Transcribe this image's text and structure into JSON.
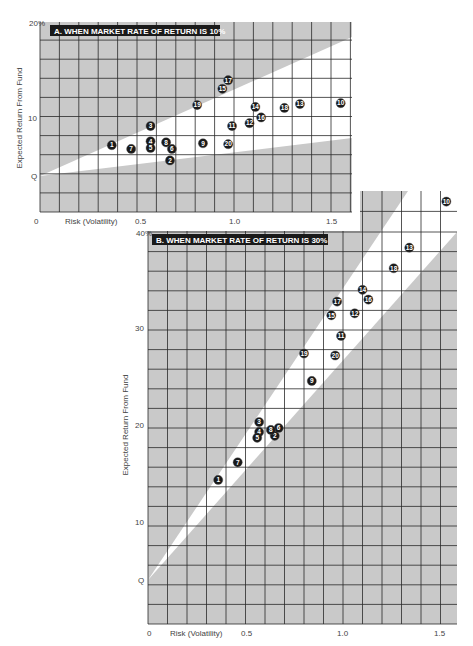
{
  "chart_data": [
    {
      "id": "A",
      "type": "scatter",
      "title": "A. WHEN MARKET RATE OF RETURN IS 10%",
      "xlabel": "Risk (Volatility)",
      "ylabel": "Expected Return From Fund",
      "x_ticks": [
        "0",
        "0.5",
        "1.0",
        "1.5"
      ],
      "x_tick_values": [
        0,
        0.5,
        1.0,
        1.5
      ],
      "y_ticks": [
        "20%",
        "10",
        "Q"
      ],
      "y_tick_values": [
        20,
        10,
        4
      ],
      "xlim": [
        0,
        1.61
      ],
      "ylim": [
        0,
        20
      ],
      "grid": true,
      "grid_step_x": 0.1,
      "grid_step_y": 2,
      "market_line": {
        "intercept_label": "Q",
        "intercept": 4,
        "band_upper_at_xmax": 18.4,
        "band_lower_at_xmax": 7.9
      },
      "points": [
        {
          "label": "1",
          "x": 0.37,
          "y": 7.0
        },
        {
          "label": "2",
          "x": 0.67,
          "y": 5.4
        },
        {
          "label": "3",
          "x": 0.57,
          "y": 9.0
        },
        {
          "label": "4",
          "x": 0.57,
          "y": 7.4
        },
        {
          "label": "5",
          "x": 0.57,
          "y": 6.7
        },
        {
          "label": "6",
          "x": 0.68,
          "y": 6.6
        },
        {
          "label": "7",
          "x": 0.47,
          "y": 6.6
        },
        {
          "label": "8",
          "x": 0.65,
          "y": 7.3
        },
        {
          "label": "9",
          "x": 0.84,
          "y": 7.2
        },
        {
          "label": "10",
          "x": 1.55,
          "y": 11.4
        },
        {
          "label": "11",
          "x": 0.99,
          "y": 9.0
        },
        {
          "label": "12",
          "x": 1.08,
          "y": 9.3
        },
        {
          "label": "13",
          "x": 1.34,
          "y": 11.3
        },
        {
          "label": "14",
          "x": 1.11,
          "y": 11.0
        },
        {
          "label": "15",
          "x": 0.94,
          "y": 12.9
        },
        {
          "label": "16",
          "x": 1.14,
          "y": 9.9
        },
        {
          "label": "17",
          "x": 0.97,
          "y": 13.8
        },
        {
          "label": "18",
          "x": 1.26,
          "y": 10.9
        },
        {
          "label": "19",
          "x": 0.81,
          "y": 11.2
        },
        {
          "label": "20",
          "x": 0.97,
          "y": 7.1
        }
      ]
    },
    {
      "id": "B",
      "type": "scatter",
      "title": "B. WHEN MARKET RATE OF RETURN IS 30%",
      "xlabel": "Risk (Volatility)",
      "ylabel": "Expected Return From Fund",
      "x_ticks": [
        "0",
        "0.5",
        "1.0",
        "1.5"
      ],
      "x_tick_values": [
        0,
        0.5,
        1.0,
        1.5
      ],
      "y_ticks": [
        "40%",
        "30",
        "20",
        "10",
        "Q"
      ],
      "y_tick_values": [
        40,
        30,
        20,
        10,
        4
      ],
      "xlim": [
        0,
        1.59
      ],
      "ylim": [
        0,
        40
      ],
      "grid": true,
      "grid_step_x": 0.1,
      "grid_step_y": 2,
      "market_line": {
        "intercept_label": "Q",
        "intercept": 4
      },
      "points": [
        {
          "label": "1",
          "x": 0.36,
          "y": 14.7
        },
        {
          "label": "2",
          "x": 0.65,
          "y": 19.2
        },
        {
          "label": "3",
          "x": 0.57,
          "y": 20.6
        },
        {
          "label": "4",
          "x": 0.57,
          "y": 19.6
        },
        {
          "label": "5",
          "x": 0.56,
          "y": 19.0
        },
        {
          "label": "6",
          "x": 0.67,
          "y": 20.0
        },
        {
          "label": "7",
          "x": 0.46,
          "y": 16.5
        },
        {
          "label": "8",
          "x": 0.63,
          "y": 19.8
        },
        {
          "label": "9",
          "x": 0.84,
          "y": 24.8
        },
        {
          "label": "10",
          "x": 1.53,
          "y": 43.1
        },
        {
          "label": "11",
          "x": 0.99,
          "y": 29.4
        },
        {
          "label": "12",
          "x": 1.06,
          "y": 31.7
        },
        {
          "label": "13",
          "x": 1.34,
          "y": 38.4
        },
        {
          "label": "14",
          "x": 1.1,
          "y": 34.1
        },
        {
          "label": "15",
          "x": 0.94,
          "y": 31.5
        },
        {
          "label": "16",
          "x": 1.13,
          "y": 33.1
        },
        {
          "label": "17",
          "x": 0.97,
          "y": 32.9
        },
        {
          "label": "18",
          "x": 1.26,
          "y": 36.3
        },
        {
          "label": "19",
          "x": 0.8,
          "y": 27.6
        },
        {
          "label": "20",
          "x": 0.96,
          "y": 27.4
        }
      ]
    }
  ],
  "colors": {
    "band_gray": "#c9c9c9",
    "grid_line": "#2a2a2a",
    "marker_fill": "#1a1a1a",
    "title_bg": "#1a1a1a",
    "background": "#ffffff"
  }
}
